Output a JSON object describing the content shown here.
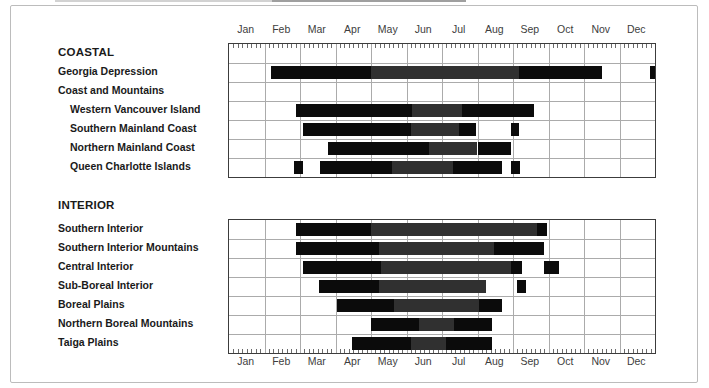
{
  "colors": {
    "bar_black": "#0b0b0b",
    "bar_gray": "#303030",
    "grid": "#ababab",
    "table_border": "#3c3c3c",
    "text": "#1a1a1a",
    "month_text": "#3d3d3d",
    "frame": "#bcbcbc"
  },
  "chart_data": {
    "type": "bar",
    "variant": "horizontal-range-bars (seasonal period chart)",
    "months": [
      "Jan",
      "Feb",
      "Mar",
      "Apr",
      "May",
      "Jun",
      "Jul",
      "Aug",
      "Sep",
      "Oct",
      "Nov",
      "Dec"
    ],
    "x_range_month_units": [
      0,
      12
    ],
    "minor_ticks_per_month": 8,
    "month_axis_positions": [
      "top",
      "bottom"
    ],
    "grid": true,
    "shades": [
      "black",
      "gray"
    ],
    "sections": [
      {
        "header": "COASTAL",
        "rows": [
          {
            "label": "Georgia Depression",
            "indent": 0,
            "segments": [
              {
                "shade": "black",
                "start": 1.17,
                "end": 3.99
              },
              {
                "shade": "gray",
                "start": 3.99,
                "end": 8.17
              },
              {
                "shade": "black",
                "start": 8.17,
                "end": 10.5
              },
              {
                "shade": "black",
                "start": 11.85,
                "end": 12.0
              }
            ]
          },
          {
            "label": "Coast and Mountains",
            "indent": 0,
            "segments": []
          },
          {
            "label": "Western Vancouver Island",
            "indent": 1,
            "segments": [
              {
                "shade": "black",
                "start": 1.88,
                "end": 5.15
              },
              {
                "shade": "gray",
                "start": 5.15,
                "end": 6.57
              },
              {
                "shade": "black",
                "start": 6.57,
                "end": 8.59
              }
            ]
          },
          {
            "label": "Southern Mainland Coast",
            "indent": 1,
            "segments": [
              {
                "shade": "black",
                "start": 2.08,
                "end": 5.12
              },
              {
                "shade": "gray",
                "start": 5.12,
                "end": 6.48
              },
              {
                "shade": "black",
                "start": 6.48,
                "end": 6.95
              },
              {
                "shade": "black",
                "start": 7.93,
                "end": 8.17
              }
            ]
          },
          {
            "label": "Northern Mainland Coast",
            "indent": 1,
            "segments": [
              {
                "shade": "black",
                "start": 2.8,
                "end": 5.63
              },
              {
                "shade": "gray",
                "start": 5.63,
                "end": 7.0
              },
              {
                "shade": "black",
                "start": 7.0,
                "end": 7.93
              }
            ]
          },
          {
            "label": "Queen Charlotte Islands",
            "indent": 1,
            "segments": [
              {
                "shade": "black",
                "start": 1.83,
                "end": 2.08
              },
              {
                "shade": "black",
                "start": 2.56,
                "end": 4.6
              },
              {
                "shade": "gray",
                "start": 4.6,
                "end": 6.31
              },
              {
                "shade": "black",
                "start": 6.31,
                "end": 7.68
              },
              {
                "shade": "black",
                "start": 7.93,
                "end": 8.19
              }
            ]
          }
        ]
      },
      {
        "header": "INTERIOR",
        "rows": [
          {
            "label": "Southern Interior",
            "indent": 0,
            "segments": [
              {
                "shade": "black",
                "start": 1.88,
                "end": 3.99
              },
              {
                "shade": "gray",
                "start": 3.99,
                "end": 8.68
              },
              {
                "shade": "black",
                "start": 8.68,
                "end": 8.97
              }
            ]
          },
          {
            "label": "Southern Interior Mountains",
            "indent": 0,
            "segments": [
              {
                "shade": "black",
                "start": 1.88,
                "end": 4.23
              },
              {
                "shade": "gray",
                "start": 4.23,
                "end": 7.46
              },
              {
                "shade": "black",
                "start": 7.46,
                "end": 8.87
              }
            ]
          },
          {
            "label": "Central Interior",
            "indent": 0,
            "segments": [
              {
                "shade": "black",
                "start": 2.08,
                "end": 4.27
              },
              {
                "shade": "gray",
                "start": 4.27,
                "end": 7.93
              },
              {
                "shade": "black",
                "start": 7.93,
                "end": 8.26
              },
              {
                "shade": "black",
                "start": 8.87,
                "end": 9.3
              }
            ]
          },
          {
            "label": "Sub-Boreal Interior",
            "indent": 0,
            "segments": [
              {
                "shade": "black",
                "start": 2.54,
                "end": 4.23
              },
              {
                "shade": "gray",
                "start": 4.23,
                "end": 7.23
              },
              {
                "shade": "black",
                "start": 8.12,
                "end": 8.36
              }
            ]
          },
          {
            "label": "Boreal Plains",
            "indent": 0,
            "segments": [
              {
                "shade": "black",
                "start": 3.05,
                "end": 4.65
              },
              {
                "shade": "gray",
                "start": 4.65,
                "end": 7.04
              },
              {
                "shade": "black",
                "start": 7.04,
                "end": 7.7
              }
            ]
          },
          {
            "label": "Northern Boreal Mountains",
            "indent": 0,
            "segments": [
              {
                "shade": "black",
                "start": 3.99,
                "end": 5.35
              },
              {
                "shade": "gray",
                "start": 5.35,
                "end": 6.34
              },
              {
                "shade": "black",
                "start": 6.34,
                "end": 7.42
              }
            ]
          },
          {
            "label": "Taiga Plains",
            "indent": 0,
            "segments": [
              {
                "shade": "black",
                "start": 3.47,
                "end": 5.12
              },
              {
                "shade": "gray",
                "start": 5.12,
                "end": 6.1
              },
              {
                "shade": "black",
                "start": 6.1,
                "end": 7.42
              }
            ]
          }
        ]
      }
    ]
  }
}
